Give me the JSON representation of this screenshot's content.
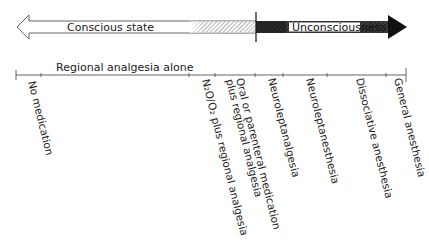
{
  "arrow": {
    "left_label": "Conscious state",
    "right_label": "Unconsciousness"
  },
  "timeline": {
    "span_label": "Regional analgesia alone",
    "ticks": [
      {
        "label": "No medication"
      },
      {
        "label": "N₂O/O₂ plus regional analgesia"
      },
      {
        "label_line1": "Oral or parenteral medication",
        "label_line2": "plus regional analgesia"
      },
      {
        "label": "Neuroleptanalgesia"
      },
      {
        "label": "Neuroleptanesthesia"
      },
      {
        "label": "Dissociative anesthesia"
      },
      {
        "label": "General anesthesia"
      }
    ]
  },
  "colors": {
    "ink": "#222222",
    "dark_fill": "#1a1a1a",
    "hatch_light": "#9a9a9a"
  }
}
